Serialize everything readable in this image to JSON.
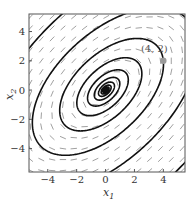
{
  "chart_data": {
    "type": "phase_portrait",
    "title": "",
    "xlabel": "x_1",
    "ylabel": "x_2",
    "xlim": [
      -5.3,
      5.5
    ],
    "ylim": [
      -5.6,
      5.2
    ],
    "xticks": [
      -4,
      -2,
      0,
      2,
      4
    ],
    "yticks": [
      -4,
      -2,
      0,
      2,
      4
    ],
    "xtick_labels": [
      "−4",
      "−2",
      "0",
      "2",
      "4"
    ],
    "ytick_labels": [
      "−4",
      "−2",
      "0",
      "2",
      "4"
    ],
    "grid": false,
    "legend": null,
    "vector_field": {
      "spacing": 0.75,
      "color": "#888888",
      "description": "direction field arrows, rotating clockwise about origin"
    },
    "trajectory": {
      "description": "spiral trajectory starting at (4,2), spiralling inward to origin in tilted ellipses",
      "start_point": [
        4,
        2
      ],
      "equilibrium": [
        0,
        0
      ],
      "color": "#111111"
    },
    "annotations": [
      {
        "text": "(4, 2)",
        "x": 4,
        "y": 2,
        "marker_color": "#999999"
      }
    ]
  },
  "labels": {
    "xlabel_main": "x",
    "xlabel_sub": "1",
    "ylabel_main": "x",
    "ylabel_sub": "2",
    "point_annotation": "(4, 2)"
  }
}
